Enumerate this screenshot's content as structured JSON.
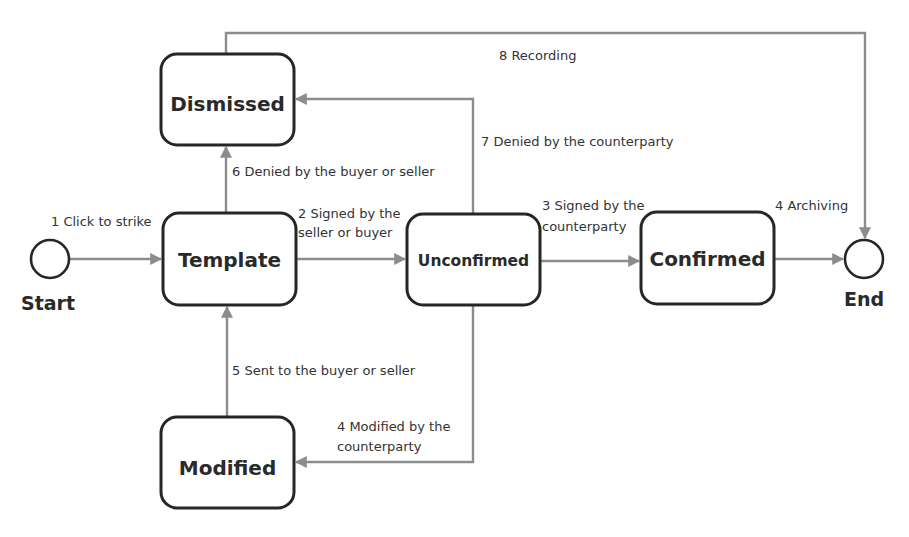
{
  "diagram": {
    "type": "state-transition",
    "colors": {
      "box_border": "#262626",
      "edge": "#8c8c8c",
      "text": "#2a2a2a",
      "background": "#ffffff"
    },
    "terminals": {
      "start": {
        "label": "Start"
      },
      "end": {
        "label": "End"
      }
    },
    "states": {
      "template": {
        "label": "Template"
      },
      "dismissed": {
        "label": "Dismissed"
      },
      "unconfirmed": {
        "label": "Unconfirmed"
      },
      "confirmed": {
        "label": "Confirmed"
      },
      "modified": {
        "label": "Modified"
      }
    },
    "transitions": {
      "t1": {
        "from": "start",
        "to": "template",
        "lines": [
          "1 Click to strike"
        ]
      },
      "t2": {
        "from": "template",
        "to": "unconfirmed",
        "lines": [
          "2 Signed by the",
          "seller or buyer"
        ]
      },
      "t3": {
        "from": "unconfirmed",
        "to": "confirmed",
        "lines": [
          "3  Signed by the",
          "counterparty"
        ]
      },
      "t4a": {
        "from": "confirmed",
        "to": "end",
        "lines": [
          "4  Archiving"
        ]
      },
      "t4b": {
        "from": "unconfirmed",
        "to": "modified",
        "lines": [
          "4 Modified by the",
          "counterparty"
        ]
      },
      "t5": {
        "from": "modified",
        "to": "template",
        "lines": [
          "5 Sent to the buyer or seller"
        ]
      },
      "t6": {
        "from": "template",
        "to": "dismissed",
        "lines": [
          "6 Denied by the buyer or seller"
        ]
      },
      "t7": {
        "from": "unconfirmed",
        "to": "dismissed",
        "lines": [
          "7 Denied by the counterparty"
        ]
      },
      "t8": {
        "from": "dismissed",
        "to": "end",
        "lines": [
          "8  Recording"
        ]
      }
    }
  }
}
